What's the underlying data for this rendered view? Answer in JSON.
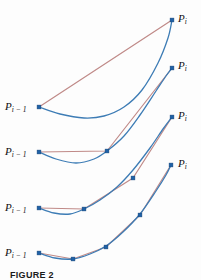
{
  "figure": {
    "caption": "FIGURE 2",
    "width": 201,
    "height": 280,
    "background": "#fdfdfd",
    "colors": {
      "curve": "#3d7cb5",
      "polyline": "#c08a88",
      "point_fill": "#1f62a8",
      "point_stroke": "#14447a",
      "label_text": "#111111",
      "caption_text": "#1a1a1a"
    },
    "labels": {
      "start": "P",
      "start_sub": "i − 1",
      "end": "P",
      "end_sub": "i"
    }
  },
  "chart_data": {
    "type": "line",
    "title": "FIGURE 2",
    "xlabel": "",
    "ylabel": "",
    "xlim": [
      0,
      201
    ],
    "ylim": [
      280,
      0
    ],
    "grid": false,
    "legend": "none",
    "panels": [
      {
        "name": "panel-1",
        "subdivision_level": 0,
        "segment_count": 1,
        "start_label": "P_{i-1}",
        "end_label": "P_i",
        "start_point": [
          39,
          107
        ],
        "end_point": [
          172,
          20
        ],
        "control_points": [
          [
            39,
            107
          ],
          [
            172,
            20
          ]
        ],
        "polyline": [
          [
            39,
            107
          ],
          [
            172,
            20
          ]
        ],
        "curve": [
          [
            39,
            107
          ],
          [
            60,
            114
          ],
          [
            84,
            118
          ],
          [
            104,
            116
          ],
          [
            124,
            107
          ],
          [
            142,
            90
          ],
          [
            158,
            63
          ],
          [
            168,
            38
          ],
          [
            172,
            20
          ]
        ],
        "start_label_pos": [
          5,
          101
        ],
        "end_label_pos": [
          178,
          13
        ]
      },
      {
        "name": "panel-2",
        "subdivision_level": 1,
        "segment_count": 2,
        "start_label": "P_{i-1}",
        "end_label": "P_i",
        "start_point": [
          39,
          152
        ],
        "end_point": [
          172,
          68
        ],
        "control_points": [
          [
            39,
            152
          ],
          [
            107,
            151
          ],
          [
            172,
            68
          ]
        ],
        "polyline": [
          [
            39,
            152
          ],
          [
            107,
            151
          ],
          [
            172,
            68
          ]
        ],
        "curve": [
          [
            39,
            152
          ],
          [
            56,
            159
          ],
          [
            76,
            163
          ],
          [
            94,
            159
          ],
          [
            107,
            151
          ],
          [
            124,
            136
          ],
          [
            140,
            115
          ],
          [
            156,
            91
          ],
          [
            166,
            76
          ],
          [
            172,
            68
          ]
        ],
        "start_label_pos": [
          5,
          146
        ],
        "end_label_pos": [
          178,
          60
        ]
      },
      {
        "name": "panel-3",
        "subdivision_level": 2,
        "segment_count": 3,
        "start_label": "P_{i-1}",
        "end_label": "P_i",
        "start_point": [
          39,
          208
        ],
        "end_point": [
          172,
          117
        ],
        "control_points": [
          [
            39,
            208
          ],
          [
            84,
            209
          ],
          [
            133,
            178
          ],
          [
            172,
            117
          ]
        ],
        "polyline": [
          [
            39,
            208
          ],
          [
            84,
            209
          ],
          [
            133,
            178
          ],
          [
            172,
            117
          ]
        ],
        "curve": [
          [
            39,
            208
          ],
          [
            54,
            213
          ],
          [
            70,
            214
          ],
          [
            84,
            209
          ],
          [
            100,
            200
          ],
          [
            117,
            187
          ],
          [
            133,
            170
          ],
          [
            150,
            148
          ],
          [
            163,
            129
          ],
          [
            172,
            117
          ]
        ],
        "start_label_pos": [
          5,
          202
        ],
        "end_label_pos": [
          178,
          110
        ]
      },
      {
        "name": "panel-4",
        "subdivision_level": 3,
        "segment_count": 4,
        "start_label": "P_{i-1}",
        "end_label": "P_i",
        "start_point": [
          39,
          253
        ],
        "end_point": [
          171,
          165
        ],
        "control_points": [
          [
            39,
            253
          ],
          [
            73,
            259
          ],
          [
            106,
            247
          ],
          [
            140,
            215
          ],
          [
            171,
            165
          ]
        ],
        "polyline": [
          [
            39,
            253
          ],
          [
            73,
            259
          ],
          [
            106,
            247
          ],
          [
            140,
            215
          ],
          [
            171,
            165
          ]
        ],
        "curve": [
          [
            39,
            253
          ],
          [
            55,
            258
          ],
          [
            73,
            259
          ],
          [
            90,
            254
          ],
          [
            106,
            246
          ],
          [
            123,
            232
          ],
          [
            140,
            214
          ],
          [
            156,
            191
          ],
          [
            166,
            175
          ],
          [
            171,
            165
          ]
        ],
        "start_label_pos": [
          5,
          247
        ],
        "end_label_pos": [
          178,
          158
        ]
      }
    ]
  }
}
